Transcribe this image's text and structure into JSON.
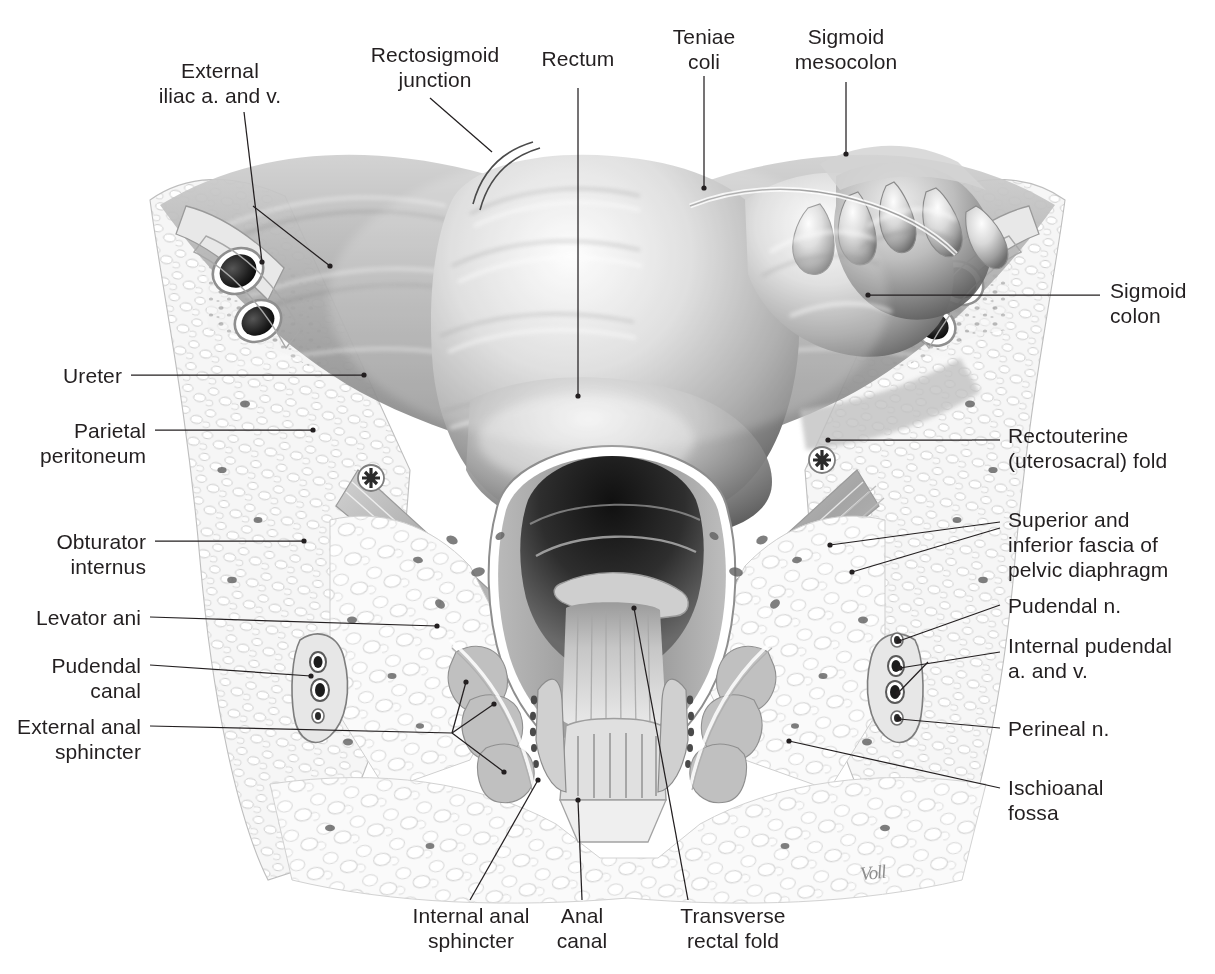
{
  "plate": {
    "title": "Coronal section of rectum, anal canal and ischioanal fossa",
    "signature": "Voll",
    "palette": {
      "text": "#231f20",
      "leader": "#231f20",
      "background": "#ffffff",
      "ink_dark": "#3b3b3b",
      "ink_mid": "#8f8f8f",
      "ink_light": "#d6d6d6"
    }
  },
  "labels": {
    "external_iliac": "External\niliac a. and v.",
    "rectosigmoid_junction": "Rectosigmoid\njunction",
    "rectum": "Rectum",
    "teniae_coli": "Teniae\ncoli",
    "sigmoid_mesocolon": "Sigmoid\nmesocolon",
    "sigmoid_colon": "Sigmoid\ncolon",
    "rectouterine_fold": "Rectouterine\n(uterosacral) fold",
    "pelvic_diaphragm_fascia": "Superior and\ninferior fascia of\npelvic diaphragm",
    "pudendal_n": "Pudendal n.",
    "internal_pudendal": "Internal pudendal\na. and v.",
    "perineal_n": "Perineal n.",
    "ischioanal_fossa": "Ischioanal\nfossa",
    "ureter": "Ureter",
    "parietal_peritoneum": "Parietal\nperitoneum",
    "obturator_internus": "Obturator\ninternus",
    "levator_ani": "Levator ani",
    "pudendal_canal": "Pudendal\ncanal",
    "external_anal_sphincter": "External anal\nsphincter",
    "internal_anal_sphincter": "Internal anal\nsphincter",
    "anal_canal": "Anal\ncanal",
    "transverse_rectal_fold": "Transverse\nrectal fold"
  }
}
